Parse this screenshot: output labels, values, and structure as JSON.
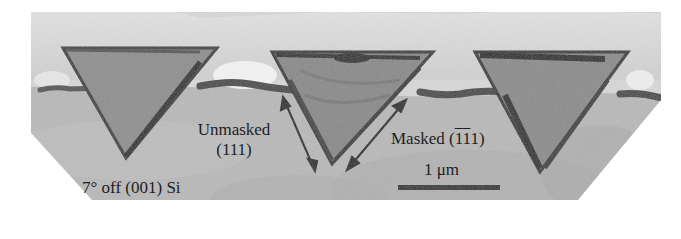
{
  "figure": {
    "type": "TEM cross-section micrograph",
    "background_color": "#ffffff",
    "substrate_color": "#b4b4b4",
    "top_region_color": "#d6d6d6",
    "triangle_fill_color": "#8e8e8e",
    "triangle_edge_color": "#3a3a3a",
    "interface_color": "#4a4a4a"
  },
  "labels": {
    "unmasked_line1": "Unmasked",
    "unmasked_line2": "(111)",
    "masked_prefix": "Masked (",
    "masked_bar1": "1",
    "masked_bar2": "1",
    "masked_suffix": "1)",
    "substrate": "7° off (001) Si",
    "scale_bar": "1 μm"
  },
  "scale_bar": {
    "length_px": 102,
    "color": "#333333"
  }
}
